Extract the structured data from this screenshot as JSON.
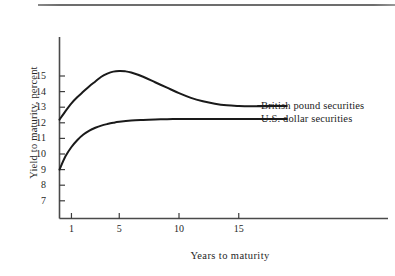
{
  "figure": {
    "has_top_rule": true,
    "background": "#ffffff",
    "ink_color": "#1a1a1a"
  },
  "chart_data": {
    "type": "line",
    "title": "",
    "xlabel": "Years to maturity",
    "ylabel": "Yield to maturity, percent",
    "xlim": [
      0,
      19
    ],
    "ylim": [
      6.3,
      16.2
    ],
    "xticks": [
      1,
      5,
      10,
      15
    ],
    "xtick_labels": [
      "1",
      "5",
      "10",
      "15"
    ],
    "yticks": [
      7,
      8,
      9,
      10,
      11,
      12,
      13,
      14,
      15
    ],
    "ytick_labels": [
      "7",
      "8",
      "9",
      "10",
      "11",
      "12",
      "13",
      "14",
      "15"
    ],
    "grid": false,
    "legend_position": "right-inline",
    "series": [
      {
        "name": "British pound securities",
        "label": "British pound securities",
        "color": "#1a1a1a",
        "x": [
          0,
          0.5,
          1,
          1.5,
          2,
          2.5,
          3,
          3.5,
          4,
          4.5,
          5,
          5.5,
          6,
          7,
          8,
          9,
          10,
          11,
          12,
          13,
          14,
          15,
          16,
          17,
          18,
          19
        ],
        "y": [
          12.2,
          12.75,
          13.25,
          13.65,
          14.0,
          14.35,
          14.65,
          14.95,
          15.15,
          15.28,
          15.32,
          15.3,
          15.22,
          14.95,
          14.6,
          14.25,
          13.9,
          13.6,
          13.38,
          13.22,
          13.12,
          13.08,
          13.06,
          13.06,
          13.07,
          13.08
        ]
      },
      {
        "name": "U.S. dollar securities",
        "label": "U.S. dollar securities",
        "color": "#1a1a1a",
        "x": [
          0,
          0.5,
          1,
          1.5,
          2,
          2.5,
          3,
          3.5,
          4,
          4.5,
          5,
          6,
          7,
          8,
          9,
          10,
          11,
          12,
          13,
          14,
          15,
          16,
          17,
          18,
          19
        ],
        "y": [
          9.0,
          9.85,
          10.45,
          10.9,
          11.25,
          11.5,
          11.68,
          11.82,
          11.92,
          12.0,
          12.06,
          12.14,
          12.18,
          12.21,
          12.23,
          12.24,
          12.25,
          12.25,
          12.25,
          12.25,
          12.25,
          12.25,
          12.25,
          12.25,
          12.25
        ]
      }
    ]
  }
}
